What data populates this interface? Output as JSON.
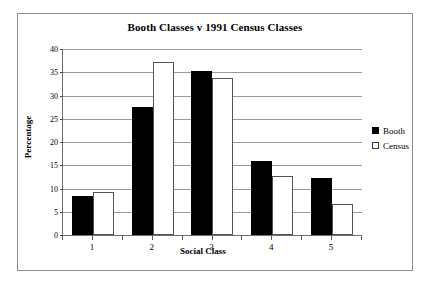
{
  "chart_data": {
    "type": "bar",
    "title": "Booth Classes v 1991 Census Classes",
    "xlabel": "Social Class",
    "ylabel": "Percentage",
    "categories": [
      "1",
      "2",
      "3",
      "4",
      "5"
    ],
    "series": [
      {
        "name": "Booth",
        "color": "#000000",
        "values": [
          8.3,
          27.6,
          35.2,
          16.0,
          12.3
        ]
      },
      {
        "name": "Census",
        "color": "#ffffff",
        "values": [
          9.2,
          37.2,
          33.7,
          12.7,
          6.6
        ]
      }
    ],
    "ylim": [
      0,
      40
    ],
    "yticks": [
      0,
      5,
      10,
      15,
      20,
      25,
      30,
      35,
      40
    ],
    "ytick_labels": [
      "0",
      "5",
      "10",
      "15",
      "20",
      "25",
      "30",
      "35",
      "40"
    ],
    "grid": true,
    "legend_position": "right"
  },
  "legend": {
    "entries": [
      {
        "label": "Booth",
        "swatch": "filled-square-icon"
      },
      {
        "label": "Census",
        "swatch": "outlined-square-icon"
      }
    ]
  }
}
